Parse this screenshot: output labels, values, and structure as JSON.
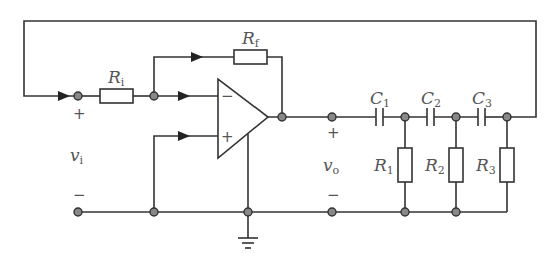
{
  "diagram": {
    "type": "circuit-schematic",
    "components": {
      "input_resistor": {
        "label": "R",
        "sub": "i"
      },
      "feedback_resistor": {
        "label": "R",
        "sub": "f"
      },
      "capacitors": [
        {
          "label": "C",
          "sub": "1"
        },
        {
          "label": "C",
          "sub": "2"
        },
        {
          "label": "C",
          "sub": "3"
        }
      ],
      "shunt_resistors": [
        {
          "label": "R",
          "sub": "1"
        },
        {
          "label": "R",
          "sub": "2"
        },
        {
          "label": "R",
          "sub": "3"
        }
      ],
      "op_amp": {
        "inverting_sign": "−",
        "noninverting_sign": "+"
      }
    },
    "ports": {
      "input": {
        "label": "v",
        "sub": "i",
        "plus": "+",
        "minus": "−"
      },
      "output": {
        "label": "v",
        "sub": "o",
        "plus": "+",
        "minus": "−"
      }
    },
    "colors": {
      "wire": "#333333",
      "node_fill": "#888888",
      "label": "#555555"
    }
  }
}
